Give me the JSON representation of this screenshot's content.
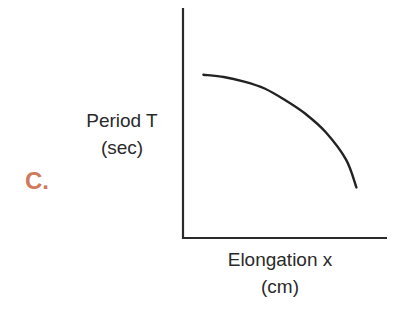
{
  "panel_label": "C.",
  "colors": {
    "panel_label": "#d07a5c",
    "axis": "#2a2a2a",
    "curve": "#222222",
    "text": "#2a2a2a"
  },
  "chart_data": {
    "type": "line",
    "title": "",
    "panel_label": "C.",
    "xlabel": "Elongation x (cm)",
    "ylabel": "Period T (sec)",
    "xlabel_lines": [
      "Elongation x",
      "(cm)"
    ],
    "ylabel_lines": [
      "Period T",
      "(sec)"
    ],
    "grid": false,
    "ticks": "none",
    "legend": null,
    "series": [
      {
        "name": "T vs x",
        "x": [
          0.1,
          0.2,
          0.3,
          0.4,
          0.5,
          0.6,
          0.7,
          0.8,
          0.85
        ],
        "y": [
          0.71,
          0.7,
          0.68,
          0.65,
          0.6,
          0.54,
          0.46,
          0.34,
          0.22
        ]
      }
    ],
    "xlim": [
      0,
      1
    ],
    "ylim": [
      0,
      1
    ]
  }
}
